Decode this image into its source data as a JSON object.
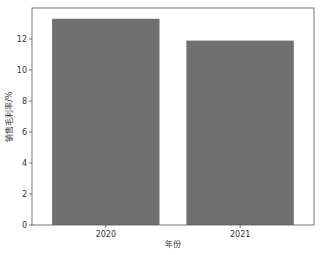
{
  "chart_data": {
    "type": "bar",
    "title": "",
    "categories": [
      "2020",
      "2021"
    ],
    "values": [
      13.3,
      11.9
    ],
    "xlabel": "年份",
    "ylabel": "销售毛利率/%",
    "ylim": [
      0,
      14.0
    ],
    "yticks": [
      0,
      2,
      4,
      6,
      8,
      10,
      12
    ],
    "ytick_labels": [
      "0",
      "2",
      "4",
      "6",
      "8",
      "10",
      "12"
    ],
    "grid": false,
    "legend": null,
    "colors": {
      "bar": "#707070",
      "axis": "#555555"
    }
  }
}
